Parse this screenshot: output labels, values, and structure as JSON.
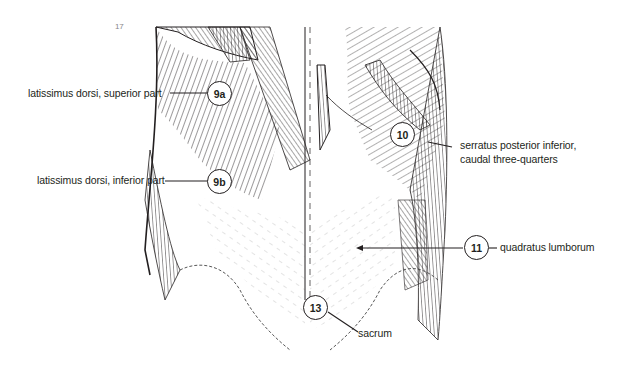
{
  "figure": {
    "corner_mark": "17"
  },
  "callouts": [
    {
      "id": "9a",
      "number": "9a",
      "label": "latissimus dorsi, superior part"
    },
    {
      "id": "9b",
      "number": "9b",
      "label": "latissimus dorsi, inferior part"
    },
    {
      "id": "10",
      "number": "10",
      "label_line1": "serratus posterior inferior,",
      "label_line2": "caudal three-quarters"
    },
    {
      "id": "11",
      "number": "11",
      "label": "quadratus lumborum"
    },
    {
      "id": "13",
      "number": "13",
      "label": "sacrum"
    }
  ],
  "colors": {
    "ink": "#231f20",
    "background": "#ffffff"
  }
}
